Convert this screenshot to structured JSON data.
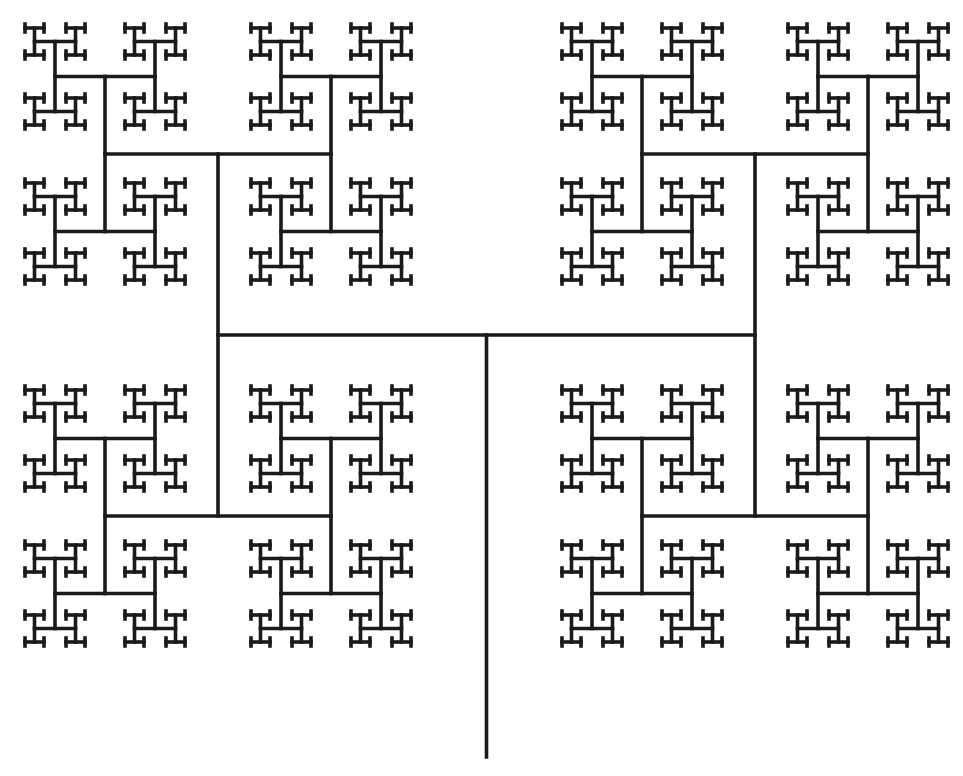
{
  "figure": {
    "background_color": "#ffffff",
    "stroke_color": "#1a1a1a",
    "stroke_width": 3.6,
    "width": 963,
    "height": 776
  },
  "h_tree": {
    "trunk": {
      "x": 486.5,
      "y_bottom": 757,
      "y_top": 335
    },
    "root_center": {
      "x": 486.5,
      "y": 335
    },
    "first_orientation": "horizontal",
    "levels": [
      {
        "level": 1,
        "orientation": "horizontal",
        "half_length": 268.5
      },
      {
        "level": 2,
        "orientation": "vertical",
        "half_length": 181
      },
      {
        "level": 3,
        "orientation": "horizontal",
        "half_length": 113
      },
      {
        "level": 4,
        "orientation": "vertical",
        "half_length": 77.5
      },
      {
        "level": 5,
        "orientation": "horizontal",
        "half_length": 50
      },
      {
        "level": 6,
        "orientation": "vertical",
        "half_length": 35
      },
      {
        "level": 7,
        "orientation": "horizontal",
        "half_length": 20.5
      },
      {
        "level": 8,
        "orientation": "vertical",
        "half_length": 13.5
      },
      {
        "level": 9,
        "orientation": "horizontal",
        "half_length": 9.5
      },
      {
        "level": 10,
        "orientation": "vertical",
        "half_length": 4
      }
    ]
  }
}
